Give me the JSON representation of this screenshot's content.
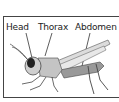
{
  "diagram": {
    "labels": [
      {
        "text": "Head"
      },
      {
        "text": "Thorax"
      },
      {
        "text": "Abdomen"
      }
    ]
  }
}
